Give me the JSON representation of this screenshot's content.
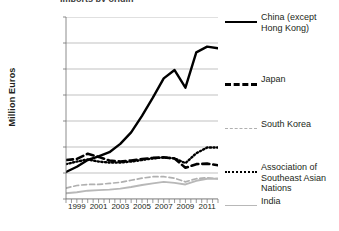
{
  "title_fragment": "Imports by origin",
  "axes": {
    "ylabel": "Million Euros",
    "yticks": [
      "0",
      "50,000",
      "100,000",
      "150,000",
      "200,000",
      "250,000",
      "300,000",
      "350,000"
    ],
    "xticks": [
      "1999",
      "2001",
      "2003",
      "2005",
      "2007",
      "2009",
      "2011"
    ]
  },
  "legend": {
    "items": [
      {
        "label": "China (except Hong Kong)",
        "style": "solid-black",
        "color": "#000000"
      },
      {
        "label": "Japan",
        "style": "dash-black",
        "color": "#000000"
      },
      {
        "label": "South Korea",
        "style": "dash-gray",
        "color": "#b0b0b0"
      },
      {
        "label": "Association of Southeast Asian Nations",
        "style": "dot-black",
        "color": "#000000"
      },
      {
        "label": "India",
        "style": "solid-gray",
        "color": "#b8b8b8"
      }
    ]
  },
  "chart_data": {
    "type": "line",
    "title": "Imports by origin",
    "xlabel": "",
    "ylabel": "Million Euros",
    "ylim": [
      0,
      350000
    ],
    "xlim": [
      1998,
      2012
    ],
    "ytick_step": 50000,
    "grid": "horizontal",
    "legend_position": "right",
    "x": [
      1998,
      1999,
      2000,
      2001,
      2002,
      2003,
      2004,
      2005,
      2006,
      2007,
      2008,
      2009,
      2010,
      2011,
      2012
    ],
    "series": [
      {
        "name": "China (except Hong Kong)",
        "color": "#000000",
        "style": "solid",
        "values": [
          52000,
          62000,
          75000,
          82000,
          90000,
          106000,
          128000,
          160000,
          195000,
          232000,
          248000,
          214000,
          282000,
          293000,
          290000
        ]
      },
      {
        "name": "Japan",
        "color": "#000000",
        "style": "dashed",
        "values": [
          75000,
          77000,
          87000,
          81000,
          74000,
          72000,
          74000,
          77000,
          79000,
          80000,
          78000,
          60000,
          67000,
          68000,
          65000
        ]
      },
      {
        "name": "South Korea",
        "color": "#b0b0b0",
        "style": "dashed",
        "values": [
          21000,
          26000,
          28000,
          28000,
          30000,
          32000,
          36000,
          40000,
          43000,
          43000,
          40000,
          33000,
          39000,
          41000,
          39000
        ]
      },
      {
        "name": "Association of Southeast Asian Nations",
        "color": "#000000",
        "style": "dotted",
        "values": [
          67000,
          72000,
          76000,
          72000,
          70000,
          70000,
          72000,
          75000,
          78000,
          80000,
          78000,
          69000,
          88000,
          99000,
          99000
        ]
      },
      {
        "name": "India",
        "color": "#b8b8b8",
        "style": "solid",
        "values": [
          11000,
          13000,
          16000,
          17000,
          18000,
          20000,
          23000,
          27000,
          30000,
          33000,
          31000,
          28000,
          35000,
          39000,
          39000
        ]
      }
    ]
  }
}
